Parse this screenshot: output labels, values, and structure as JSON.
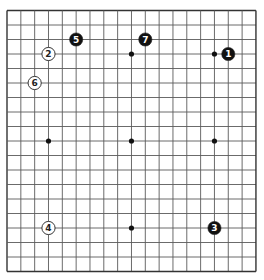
{
  "board": {
    "size": 19,
    "origin": {
      "x": 7,
      "y": 10.5
    },
    "spacing": {
      "x": 13.83,
      "y": 14.5
    },
    "line_color": "#5a5a5a",
    "border_color": "#333333",
    "background": "#ffffff"
  },
  "star_points": [
    {
      "col": 3,
      "row": 3
    },
    {
      "col": 9,
      "row": 3
    },
    {
      "col": 15,
      "row": 3
    },
    {
      "col": 3,
      "row": 9
    },
    {
      "col": 9,
      "row": 9
    },
    {
      "col": 15,
      "row": 9
    },
    {
      "col": 3,
      "row": 15
    },
    {
      "col": 9,
      "row": 15
    },
    {
      "col": 15,
      "row": 15
    }
  ],
  "stones": [
    {
      "move": "1",
      "color": "black",
      "col": 16,
      "row": 3
    },
    {
      "move": "2",
      "color": "white",
      "col": 3,
      "row": 3
    },
    {
      "move": "3",
      "color": "black",
      "col": 15,
      "row": 15
    },
    {
      "move": "4",
      "color": "white",
      "col": 3,
      "row": 15
    },
    {
      "move": "5",
      "color": "black",
      "col": 5,
      "row": 2
    },
    {
      "move": "6",
      "color": "white",
      "col": 2,
      "row": 5
    },
    {
      "move": "7",
      "color": "black",
      "col": 10,
      "row": 2
    }
  ]
}
